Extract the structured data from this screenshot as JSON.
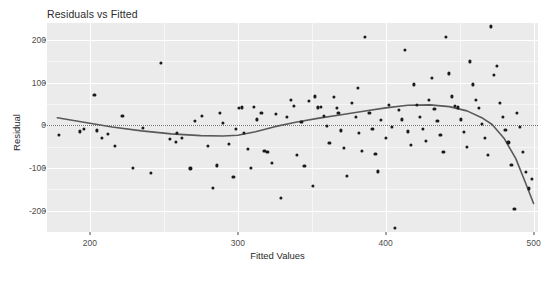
{
  "chart_data": {
    "type": "scatter",
    "title": "Residuals vs Fitted",
    "xlabel": "Fitted Values",
    "ylabel": "Residual",
    "xlim": [
      171,
      503
    ],
    "ylim": [
      -250,
      240
    ],
    "xticks": [
      200,
      300,
      400,
      500
    ],
    "yticks": [
      200,
      100,
      0,
      -100,
      -200
    ],
    "xtick_labels": [
      "200",
      "300",
      "400",
      "500"
    ],
    "ytick_labels": [
      "200",
      "100",
      "0",
      "-100",
      "-200"
    ],
    "grid": true,
    "legend": "none",
    "point_color": "#1a1a1a",
    "panel_color": "#ebebeb",
    "gridline_color": "#ffffff",
    "reference_line": {
      "style": "dotted",
      "orientation": "horizontal",
      "y": 0,
      "color": "#6e6e6e"
    },
    "smooth": {
      "method": "loess",
      "color": "#595959",
      "x": [
        178,
        195,
        215,
        235,
        255,
        275,
        290,
        300,
        312,
        325,
        340,
        355,
        370,
        385,
        400,
        415,
        430,
        443,
        455,
        465,
        472,
        480,
        488,
        494,
        500
      ],
      "y": [
        18,
        8,
        -4,
        -13,
        -20,
        -24,
        -25,
        -23,
        -15,
        -3,
        8,
        17,
        25,
        33,
        41,
        47,
        48,
        44,
        34,
        18,
        2,
        -30,
        -78,
        -130,
        -183
      ]
    },
    "points": [
      {
        "x": 179,
        "y": -22
      },
      {
        "x": 196,
        "y": -8
      },
      {
        "x": 203,
        "y": 72
      },
      {
        "x": 205,
        "y": -12
      },
      {
        "x": 208,
        "y": -30
      },
      {
        "x": 212,
        "y": -20
      },
      {
        "x": 222,
        "y": 23
      },
      {
        "x": 229,
        "y": -100
      },
      {
        "x": 236,
        "y": -5
      },
      {
        "x": 248,
        "y": 147
      },
      {
        "x": 254,
        "y": -32
      },
      {
        "x": 258,
        "y": -38
      },
      {
        "x": 259,
        "y": -18
      },
      {
        "x": 262,
        "y": -30
      },
      {
        "x": 268,
        "y": -101
      },
      {
        "x": 271,
        "y": 10
      },
      {
        "x": 276,
        "y": 22
      },
      {
        "x": 280,
        "y": -48
      },
      {
        "x": 283,
        "y": -147
      },
      {
        "x": 288,
        "y": 30
      },
      {
        "x": 290,
        "y": 5
      },
      {
        "x": 294,
        "y": -44
      },
      {
        "x": 297,
        "y": -120
      },
      {
        "x": 301,
        "y": 40
      },
      {
        "x": 303,
        "y": 42
      },
      {
        "x": 304,
        "y": -18
      },
      {
        "x": 307,
        "y": -56
      },
      {
        "x": 309,
        "y": -100
      },
      {
        "x": 313,
        "y": 14
      },
      {
        "x": 316,
        "y": 30
      },
      {
        "x": 318,
        "y": -60
      },
      {
        "x": 320,
        "y": -62
      },
      {
        "x": 323,
        "y": -88
      },
      {
        "x": 326,
        "y": 26
      },
      {
        "x": 329,
        "y": -170
      },
      {
        "x": 333,
        "y": 20
      },
      {
        "x": 336,
        "y": 60
      },
      {
        "x": 338,
        "y": 45
      },
      {
        "x": 340,
        "y": -70
      },
      {
        "x": 343,
        "y": 8
      },
      {
        "x": 345,
        "y": -95
      },
      {
        "x": 348,
        "y": 58
      },
      {
        "x": 352,
        "y": 68
      },
      {
        "x": 354,
        "y": 42
      },
      {
        "x": 356,
        "y": 44
      },
      {
        "x": 358,
        "y": 22
      },
      {
        "x": 360,
        "y": -2
      },
      {
        "x": 362,
        "y": -42
      },
      {
        "x": 365,
        "y": 66
      },
      {
        "x": 367,
        "y": 40
      },
      {
        "x": 368,
        "y": 30
      },
      {
        "x": 370,
        "y": -12
      },
      {
        "x": 372,
        "y": -52
      },
      {
        "x": 374,
        "y": -118
      },
      {
        "x": 377,
        "y": 52
      },
      {
        "x": 380,
        "y": 20
      },
      {
        "x": 382,
        "y": -18
      },
      {
        "x": 384,
        "y": -60
      },
      {
        "x": 386,
        "y": 208
      },
      {
        "x": 389,
        "y": 30
      },
      {
        "x": 391,
        "y": -8
      },
      {
        "x": 393,
        "y": -66
      },
      {
        "x": 395,
        "y": -108
      },
      {
        "x": 397,
        "y": 12
      },
      {
        "x": 400,
        "y": -30
      },
      {
        "x": 402,
        "y": 48
      },
      {
        "x": 404,
        "y": -4
      },
      {
        "x": 406,
        "y": -240
      },
      {
        "x": 409,
        "y": 36
      },
      {
        "x": 411,
        "y": 14
      },
      {
        "x": 413,
        "y": 176
      },
      {
        "x": 415,
        "y": -14
      },
      {
        "x": 417,
        "y": -46
      },
      {
        "x": 419,
        "y": 96
      },
      {
        "x": 421,
        "y": 48
      },
      {
        "x": 423,
        "y": 20
      },
      {
        "x": 425,
        "y": -8
      },
      {
        "x": 427,
        "y": -36
      },
      {
        "x": 429,
        "y": 60
      },
      {
        "x": 431,
        "y": 112
      },
      {
        "x": 433,
        "y": 38
      },
      {
        "x": 435,
        "y": 10
      },
      {
        "x": 437,
        "y": -22
      },
      {
        "x": 439,
        "y": -62
      },
      {
        "x": 441,
        "y": 208
      },
      {
        "x": 443,
        "y": 122
      },
      {
        "x": 445,
        "y": 68
      },
      {
        "x": 447,
        "y": 46
      },
      {
        "x": 449,
        "y": 42
      },
      {
        "x": 451,
        "y": 14
      },
      {
        "x": 453,
        "y": -16
      },
      {
        "x": 455,
        "y": -50
      },
      {
        "x": 457,
        "y": 150
      },
      {
        "x": 459,
        "y": 96
      },
      {
        "x": 461,
        "y": 60
      },
      {
        "x": 463,
        "y": 40
      },
      {
        "x": 465,
        "y": 4
      },
      {
        "x": 467,
        "y": -30
      },
      {
        "x": 469,
        "y": -70
      },
      {
        "x": 471,
        "y": 232
      },
      {
        "x": 473,
        "y": 118
      },
      {
        "x": 475,
        "y": 140
      },
      {
        "x": 477,
        "y": 52
      },
      {
        "x": 479,
        "y": 20
      },
      {
        "x": 481,
        "y": -10
      },
      {
        "x": 483,
        "y": -40
      },
      {
        "x": 485,
        "y": -92
      },
      {
        "x": 487,
        "y": -196
      },
      {
        "x": 489,
        "y": 30
      },
      {
        "x": 491,
        "y": -4
      },
      {
        "x": 493,
        "y": -62
      },
      {
        "x": 495,
        "y": -110
      },
      {
        "x": 497,
        "y": -148
      },
      {
        "x": 499,
        "y": -126
      },
      {
        "x": 381,
        "y": 88
      },
      {
        "x": 351,
        "y": -142
      },
      {
        "x": 311,
        "y": 44
      },
      {
        "x": 299,
        "y": -8
      },
      {
        "x": 286,
        "y": -94
      },
      {
        "x": 241,
        "y": -112
      },
      {
        "x": 217,
        "y": -48
      },
      {
        "x": 193,
        "y": -14
      }
    ]
  }
}
